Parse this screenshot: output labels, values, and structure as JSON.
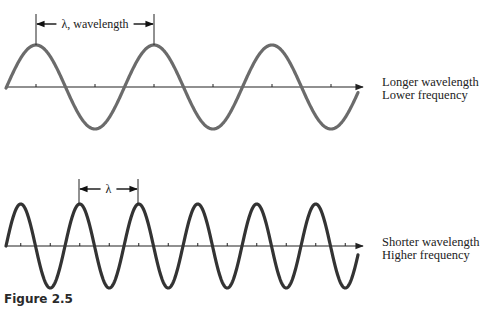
{
  "figure": {
    "caption": "Figure 2.5",
    "waves": [
      {
        "id": "long",
        "description_line1": "Longer wavelength",
        "description_line2": "Lower frequency",
        "measure_label": "λ, wavelength",
        "color": "#6b6b6b",
        "baseline_y": 87,
        "start_x": 6,
        "end_x": 358,
        "axis_end_x": 363,
        "wavelength_px": 118,
        "amplitude_px": 42,
        "first_peak_x": 36,
        "measure_from_x": 36,
        "measure_to_x": 154,
        "measure_y": 24,
        "tick_spacing_px": 59
      },
      {
        "id": "short",
        "description_line1": "Shorter wavelength",
        "description_line2": "Higher frequency",
        "measure_label": "λ",
        "color": "#333333",
        "baseline_y": 246,
        "start_x": 6,
        "end_x": 358,
        "axis_end_x": 363,
        "wavelength_px": 59,
        "amplitude_px": 42,
        "first_peak_x": 20.75,
        "measure_from_x": 79,
        "measure_to_x": 138,
        "measure_y": 189,
        "tick_spacing_px": 29.5
      }
    ]
  }
}
